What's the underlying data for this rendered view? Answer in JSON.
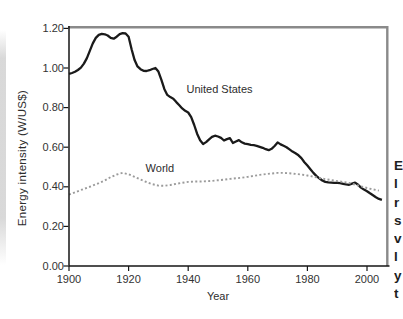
{
  "chart_data": {
    "type": "line",
    "title": "",
    "xlabel": "Year",
    "ylabel": "Energy intensity (W/US$)",
    "xlim": [
      1900,
      2007
    ],
    "ylim": [
      0,
      1.2
    ],
    "grid": false,
    "legend": "inline-annotations",
    "frame_color": "#8a8a8a",
    "axis_color": "#161616",
    "x_ticks": [
      {
        "label": "1900",
        "value": 1900
      },
      {
        "label": "1920",
        "value": 1920
      },
      {
        "label": "1940",
        "value": 1940
      },
      {
        "label": "1960",
        "value": 1960
      },
      {
        "label": "1980",
        "value": 1980
      },
      {
        "label": "2000",
        "value": 2000
      }
    ],
    "y_ticks": [
      {
        "label": "1.20",
        "value": 1.2
      },
      {
        "label": "1.00",
        "value": 1.0
      },
      {
        "label": "0.80",
        "value": 0.8
      },
      {
        "label": "0.60",
        "value": 0.6
      },
      {
        "label": "0.40",
        "value": 0.4
      },
      {
        "label": "0.20",
        "value": 0.2
      },
      {
        "label": "0.00",
        "value": 0.0
      }
    ],
    "annotations": [
      {
        "text": "United States",
        "x": 1950.5,
        "y": 0.894
      },
      {
        "text": "World",
        "x": 1930.5,
        "y": 0.497
      }
    ],
    "series": [
      {
        "id": "united-states",
        "name": "United States",
        "style": "solid",
        "color": "#1a1a1a",
        "width": 2.3,
        "points": [
          [
            1900,
            0.97
          ],
          [
            1901,
            0.975
          ],
          [
            1902,
            0.981
          ],
          [
            1903,
            0.99
          ],
          [
            1904,
            1.002
          ],
          [
            1905,
            1.022
          ],
          [
            1906,
            1.05
          ],
          [
            1907,
            1.088
          ],
          [
            1908,
            1.124
          ],
          [
            1909,
            1.152
          ],
          [
            1910,
            1.167
          ],
          [
            1911,
            1.172
          ],
          [
            1912,
            1.17
          ],
          [
            1913,
            1.164
          ],
          [
            1914,
            1.152
          ],
          [
            1915,
            1.148
          ],
          [
            1916,
            1.158
          ],
          [
            1917,
            1.171
          ],
          [
            1918,
            1.176
          ],
          [
            1919,
            1.174
          ],
          [
            1920,
            1.158
          ],
          [
            1921,
            1.095
          ],
          [
            1922,
            1.04
          ],
          [
            1923,
            1.008
          ],
          [
            1924,
            0.994
          ],
          [
            1925,
            0.986
          ],
          [
            1926,
            0.985
          ],
          [
            1927,
            0.989
          ],
          [
            1928,
            0.995
          ],
          [
            1929,
            1.0
          ],
          [
            1930,
            0.982
          ],
          [
            1931,
            0.94
          ],
          [
            1932,
            0.893
          ],
          [
            1933,
            0.864
          ],
          [
            1934,
            0.853
          ],
          [
            1935,
            0.845
          ],
          [
            1936,
            0.828
          ],
          [
            1937,
            0.812
          ],
          [
            1938,
            0.796
          ],
          [
            1939,
            0.784
          ],
          [
            1940,
            0.775
          ],
          [
            1941,
            0.752
          ],
          [
            1942,
            0.712
          ],
          [
            1943,
            0.668
          ],
          [
            1944,
            0.635
          ],
          [
            1945,
            0.616
          ],
          [
            1946,
            0.626
          ],
          [
            1947,
            0.64
          ],
          [
            1948,
            0.652
          ],
          [
            1949,
            0.658
          ],
          [
            1950,
            0.654
          ],
          [
            1951,
            0.647
          ],
          [
            1952,
            0.634
          ],
          [
            1953,
            0.641
          ],
          [
            1954,
            0.646
          ],
          [
            1955,
            0.621
          ],
          [
            1956,
            0.629
          ],
          [
            1957,
            0.636
          ],
          [
            1958,
            0.625
          ],
          [
            1959,
            0.618
          ],
          [
            1960,
            0.615
          ],
          [
            1961,
            0.612
          ],
          [
            1962,
            0.61
          ],
          [
            1963,
            0.607
          ],
          [
            1964,
            0.602
          ],
          [
            1965,
            0.597
          ],
          [
            1966,
            0.59
          ],
          [
            1967,
            0.585
          ],
          [
            1968,
            0.592
          ],
          [
            1969,
            0.606
          ],
          [
            1970,
            0.624
          ],
          [
            1971,
            0.614
          ],
          [
            1972,
            0.607
          ],
          [
            1973,
            0.6
          ],
          [
            1974,
            0.589
          ],
          [
            1975,
            0.578
          ],
          [
            1976,
            0.569
          ],
          [
            1977,
            0.559
          ],
          [
            1978,
            0.545
          ],
          [
            1979,
            0.524
          ],
          [
            1980,
            0.507
          ],
          [
            1981,
            0.489
          ],
          [
            1982,
            0.47
          ],
          [
            1983,
            0.455
          ],
          [
            1984,
            0.443
          ],
          [
            1985,
            0.432
          ],
          [
            1986,
            0.425
          ],
          [
            1987,
            0.422
          ],
          [
            1988,
            0.421
          ],
          [
            1989,
            0.42
          ],
          [
            1990,
            0.42
          ],
          [
            1991,
            0.418
          ],
          [
            1992,
            0.415
          ],
          [
            1993,
            0.412
          ],
          [
            1994,
            0.41
          ],
          [
            1995,
            0.416
          ],
          [
            1996,
            0.421
          ],
          [
            1997,
            0.41
          ],
          [
            1998,
            0.396
          ],
          [
            1999,
            0.386
          ],
          [
            2000,
            0.378
          ],
          [
            2001,
            0.367
          ],
          [
            2002,
            0.357
          ],
          [
            2003,
            0.347
          ],
          [
            2004,
            0.339
          ],
          [
            2005,
            0.334
          ]
        ]
      },
      {
        "id": "world",
        "name": "World",
        "style": "dashed",
        "dash": "2 2.3",
        "color": "#9b9b9b",
        "width": 1.9,
        "points": [
          [
            1900,
            0.36
          ],
          [
            1902,
            0.372
          ],
          [
            1904,
            0.384
          ],
          [
            1906,
            0.395
          ],
          [
            1908,
            0.406
          ],
          [
            1910,
            0.418
          ],
          [
            1912,
            0.432
          ],
          [
            1914,
            0.449
          ],
          [
            1916,
            0.462
          ],
          [
            1918,
            0.47
          ],
          [
            1920,
            0.463
          ],
          [
            1922,
            0.45
          ],
          [
            1924,
            0.437
          ],
          [
            1926,
            0.424
          ],
          [
            1928,
            0.413
          ],
          [
            1930,
            0.406
          ],
          [
            1932,
            0.405
          ],
          [
            1934,
            0.409
          ],
          [
            1936,
            0.415
          ],
          [
            1938,
            0.42
          ],
          [
            1940,
            0.425
          ],
          [
            1942,
            0.427
          ],
          [
            1944,
            0.427
          ],
          [
            1946,
            0.428
          ],
          [
            1948,
            0.43
          ],
          [
            1950,
            0.433
          ],
          [
            1952,
            0.436
          ],
          [
            1954,
            0.44
          ],
          [
            1956,
            0.443
          ],
          [
            1958,
            0.446
          ],
          [
            1960,
            0.45
          ],
          [
            1962,
            0.455
          ],
          [
            1964,
            0.46
          ],
          [
            1966,
            0.464
          ],
          [
            1968,
            0.467
          ],
          [
            1970,
            0.47
          ],
          [
            1972,
            0.47
          ],
          [
            1974,
            0.468
          ],
          [
            1976,
            0.465
          ],
          [
            1978,
            0.462
          ],
          [
            1980,
            0.457
          ],
          [
            1982,
            0.451
          ],
          [
            1984,
            0.445
          ],
          [
            1986,
            0.439
          ],
          [
            1988,
            0.434
          ],
          [
            1990,
            0.429
          ],
          [
            1992,
            0.424
          ],
          [
            1994,
            0.419
          ],
          [
            1996,
            0.411
          ],
          [
            1998,
            0.402
          ],
          [
            2000,
            0.394
          ],
          [
            2002,
            0.387
          ],
          [
            2004,
            0.381
          ]
        ]
      }
    ]
  },
  "page_edge": {
    "clipped_text_marks": [
      "E",
      "l",
      "r",
      "s",
      "v",
      "l",
      "y",
      "t"
    ]
  }
}
